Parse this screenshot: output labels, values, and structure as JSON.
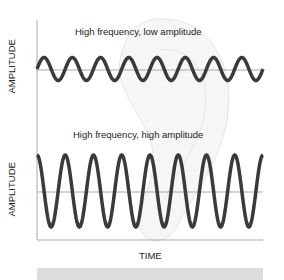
{
  "diagram": {
    "panels": [
      {
        "title": "High frequency, low amplitude",
        "ylabel": "AMPLITUDE",
        "amplitude": "low",
        "cycles": 8
      },
      {
        "title": "High frequency, high amplitude",
        "ylabel": "AMPLITUDE",
        "amplitude": "high",
        "cycles": 8
      }
    ],
    "xlabel": "TIME",
    "colors": {
      "wave": "#3a3a3a",
      "axis": "#aaaaaa",
      "background_ear": "#e6e6e6"
    }
  }
}
